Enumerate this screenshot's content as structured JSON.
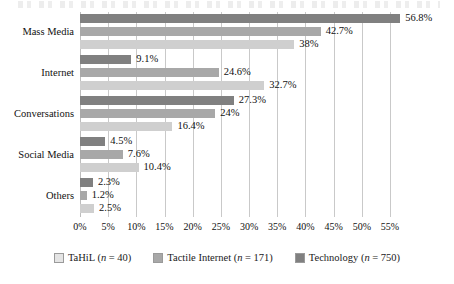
{
  "chart_data": {
    "type": "bar",
    "orientation": "horizontal",
    "title": "",
    "xlabel": "",
    "ylabel": "",
    "xlim": [
      0,
      55
    ],
    "xticks": [
      "0%",
      "5%",
      "10%",
      "15%",
      "20%",
      "25%",
      "30%",
      "35%",
      "40%",
      "45%",
      "50%",
      "55%"
    ],
    "xtick_values": [
      0,
      5,
      10,
      15,
      20,
      25,
      30,
      35,
      40,
      45,
      50,
      55
    ],
    "grid": true,
    "grid_axis": "x",
    "legend_position": "bottom",
    "categories": [
      "Mass Media",
      "Internet",
      "Conversations",
      "Social Media",
      "Others"
    ],
    "series": [
      {
        "name": "Technology (n = 750)",
        "short_name": "Technology",
        "n": 750,
        "color": "#808080",
        "values": [
          56.8,
          9.1,
          27.3,
          4.5,
          2.3
        ],
        "labels": [
          "56.8%",
          "9.1%",
          "27.3%",
          "4.5%",
          "2.3%"
        ]
      },
      {
        "name": "Tactile Internet (n = 171)",
        "short_name": "Tactile Internet",
        "n": 171,
        "color": "#a8a8a8",
        "values": [
          42.7,
          24.6,
          24.0,
          7.6,
          1.2
        ],
        "labels": [
          "42.7%",
          "24.6%",
          "24%",
          "7.6%",
          "1.2%"
        ]
      },
      {
        "name": "TaHiL (n = 40)",
        "short_name": "TaHiL",
        "n": 40,
        "color": "#cfcfcf",
        "values": [
          38.0,
          32.7,
          16.4,
          10.4,
          2.5
        ],
        "labels": [
          "38%",
          "32.7%",
          "16.4%",
          "10.4%",
          "2.5%"
        ]
      }
    ]
  },
  "legend": {
    "items": [
      {
        "label_prefix": "TaHiL",
        "n_text": "(n = 40)",
        "swatch": "s2"
      },
      {
        "label_prefix": "Tactile Internet",
        "n_text": "(n = 171)",
        "swatch": "s1"
      },
      {
        "label_prefix": "Technology",
        "n_text": "(n = 750)",
        "swatch": "s0"
      }
    ]
  }
}
